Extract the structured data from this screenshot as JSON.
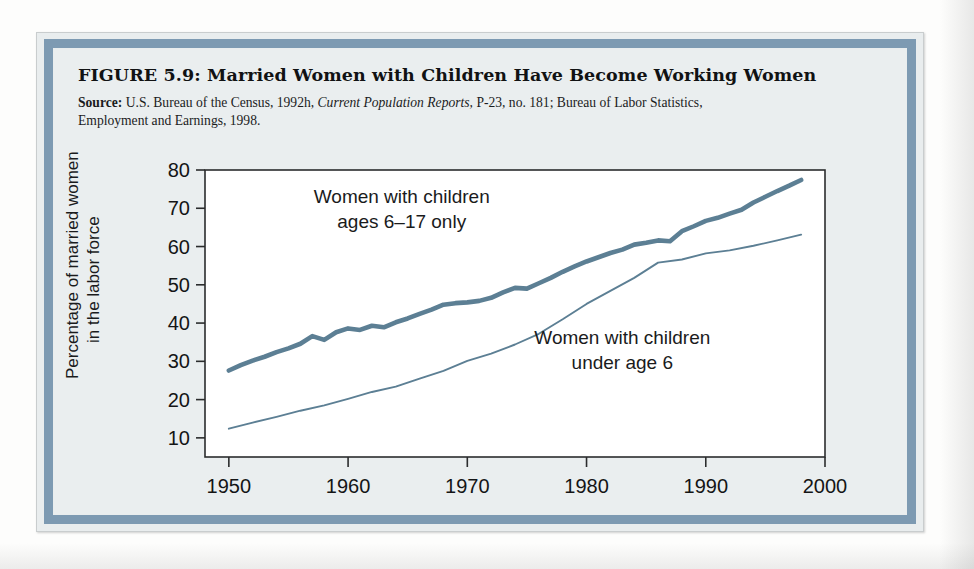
{
  "figure": {
    "title": "FIGURE 5.9:  Married Women with Children Have Become Working Women",
    "source_label": "Source:",
    "source_text_1": " U.S. Bureau of the Census, 1992h, ",
    "source_italic": "Current Population Reports,",
    "source_text_2": " P-23, no. 181; Bureau of Labor Statistics,",
    "source_text_3": "Employment and Earnings, 1998."
  },
  "colors": {
    "line": "#5c7f94",
    "frame_band": "#7d9ab2",
    "panel_background": "#eaeeef",
    "plot_background": "#ffffff",
    "axis": "#2b2c2d",
    "text": "#141516"
  },
  "chart_data": {
    "type": "line",
    "title": "Married Women with Children Have Become Working Women",
    "xlabel": "",
    "ylabel": "Percentage of married women in the labor force",
    "ylabel_line1": "Percentage of married women",
    "ylabel_line2": "in the labor force",
    "xlim": [
      1948,
      2000
    ],
    "ylim": [
      5,
      80
    ],
    "xticks": [
      1950,
      1960,
      1970,
      1980,
      1990,
      2000
    ],
    "xtick_labels": [
      "1950",
      "1960",
      "1970",
      "1980",
      "1990",
      "2000"
    ],
    "yticks": [
      10,
      20,
      30,
      40,
      50,
      60,
      70,
      80
    ],
    "ytick_labels": [
      "10",
      "20",
      "30",
      "40",
      "50",
      "60",
      "70",
      "80"
    ],
    "grid": false,
    "legend_position": "inline-annotations",
    "annotations": [
      {
        "name": "annotation-ages-6-17",
        "line1": "Women with children",
        "line2": "ages 6–17 only",
        "x": 1964.5,
        "y": 71.5
      },
      {
        "name": "annotation-under-age-6",
        "line1": "Women with children",
        "line2": "under age 6",
        "x": 1983.0,
        "y": 34.5
      }
    ],
    "series": [
      {
        "name": "Women with children ages 6-17 only",
        "style": "thick",
        "color": "#5c7f94",
        "x": [
          1950,
          1951,
          1952,
          1953,
          1954,
          1955,
          1956,
          1957,
          1958,
          1959,
          1960,
          1961,
          1962,
          1963,
          1964,
          1965,
          1966,
          1967,
          1968,
          1969,
          1970,
          1971,
          1972,
          1973,
          1974,
          1975,
          1976,
          1977,
          1978,
          1979,
          1980,
          1981,
          1982,
          1983,
          1984,
          1985,
          1986,
          1987,
          1988,
          1989,
          1990,
          1991,
          1992,
          1993,
          1994,
          1995,
          1996,
          1997,
          1998
        ],
        "values": [
          27.6,
          29.0,
          30.2,
          31.2,
          32.4,
          33.4,
          34.6,
          36.6,
          35.6,
          37.6,
          38.6,
          38.2,
          39.3,
          38.9,
          40.2,
          41.2,
          42.4,
          43.5,
          44.8,
          45.2,
          45.4,
          45.8,
          46.6,
          48.0,
          49.2,
          49.0,
          50.4,
          51.8,
          53.4,
          54.8,
          56.1,
          57.2,
          58.3,
          59.2,
          60.5,
          61.0,
          61.6,
          61.4,
          64.0,
          65.3,
          66.7,
          67.5,
          68.6,
          69.6,
          71.5,
          73.0,
          74.5,
          75.9,
          77.4
        ]
      },
      {
        "name": "Women with children under age 6",
        "style": "thin",
        "color": "#5c7f94",
        "x": [
          1950,
          1952,
          1954,
          1956,
          1958,
          1960,
          1962,
          1964,
          1966,
          1968,
          1970,
          1972,
          1974,
          1976,
          1978,
          1980,
          1982,
          1984,
          1986,
          1988,
          1990,
          1992,
          1994,
          1996,
          1998
        ],
        "values": [
          12.4,
          14.0,
          15.5,
          17.1,
          18.5,
          20.2,
          22.0,
          23.4,
          25.5,
          27.5,
          30.1,
          32.0,
          34.4,
          37.2,
          41.0,
          45.0,
          48.4,
          51.8,
          55.8,
          56.6,
          58.2,
          59.0,
          60.2,
          61.6,
          63.1
        ]
      }
    ]
  }
}
